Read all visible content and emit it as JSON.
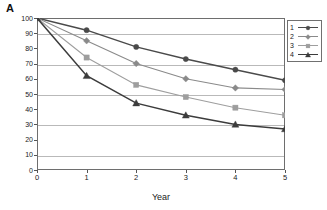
{
  "panel": {
    "label": "A"
  },
  "chart_data": {
    "type": "line",
    "title": "",
    "xlabel": "Year",
    "ylabel": "Percent Alive",
    "x": [
      0,
      1,
      2,
      3,
      4,
      5
    ],
    "xlim": [
      0,
      5
    ],
    "ylim": [
      0,
      100
    ],
    "xticks": [
      "0",
      "1",
      "2",
      "3",
      "4",
      "5"
    ],
    "yticks": [
      "0",
      "10",
      "20",
      "30",
      "40",
      "50",
      "60",
      "70",
      "80",
      "90",
      "100"
    ],
    "gridlines_at": [
      10,
      30,
      50,
      70,
      90
    ],
    "grid": true,
    "legend_position": "upper-right",
    "series": [
      {
        "name": "1",
        "marker": "circle",
        "color": "#4a4a4a",
        "values": [
          100,
          92,
          81,
          73,
          66,
          59
        ]
      },
      {
        "name": "2",
        "marker": "diamond",
        "color": "#8a8a8a",
        "values": [
          100,
          85,
          70,
          60,
          54,
          53
        ]
      },
      {
        "name": "3",
        "marker": "square",
        "color": "#9e9e9e",
        "values": [
          100,
          74,
          56,
          48,
          41,
          36
        ]
      },
      {
        "name": "4",
        "marker": "triangle",
        "color": "#3c3c3c",
        "values": [
          100,
          62,
          44,
          36,
          30,
          27
        ]
      }
    ]
  },
  "legend": {
    "entries": [
      {
        "label": "1"
      },
      {
        "label": "2"
      },
      {
        "label": "3"
      },
      {
        "label": "4"
      }
    ]
  }
}
